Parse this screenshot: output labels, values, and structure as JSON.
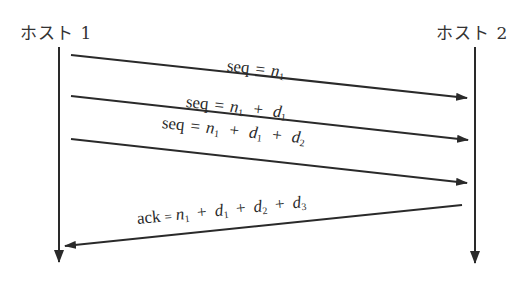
{
  "diagram": {
    "type": "sequence",
    "hosts": [
      {
        "id": "host1",
        "label": "ホスト 1"
      },
      {
        "id": "host2",
        "label": "ホスト 2"
      }
    ],
    "messages": [
      {
        "from": "host1",
        "to": "host2",
        "label": "seq = n1",
        "parts": {
          "key": "seq",
          "eq": "=",
          "n": "n",
          "n_sub": "1"
        }
      },
      {
        "from": "host1",
        "to": "host2",
        "label": "seq = n1 + d1",
        "parts": {
          "key": "seq",
          "eq": "=",
          "n": "n",
          "n_sub": "1",
          "plus": "+",
          "d": "d",
          "d1_sub": "1"
        }
      },
      {
        "from": "host1",
        "to": "host2",
        "label": "seq = n1 + d1 + d2",
        "parts": {
          "key": "seq",
          "eq": "=",
          "n": "n",
          "n_sub": "1",
          "plus": "+",
          "d": "d",
          "d1_sub": "1",
          "d2_sub": "2"
        }
      },
      {
        "from": "host2",
        "to": "host1",
        "label": "ack = n1 + d1 + d2 + d3",
        "parts": {
          "key": "ack",
          "eq": "=",
          "n": "n",
          "n_sub": "1",
          "plus": "+",
          "d": "d",
          "d1_sub": "1",
          "d2_sub": "2",
          "d3_sub": "3"
        }
      }
    ],
    "colors": {
      "line": "#2a2a2a",
      "background": "#ffffff"
    }
  }
}
